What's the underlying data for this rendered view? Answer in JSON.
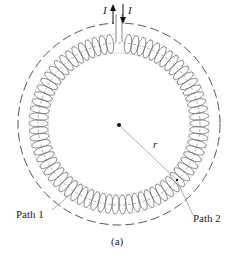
{
  "figure": {
    "caption": "(a)",
    "current_label_up": "I",
    "current_label_down": "I",
    "radius_label": "r",
    "path1_label": "Path 1",
    "path2_label": "Path 2",
    "turns": 72,
    "colors": {
      "coil": "#6b6b6b",
      "dashed_path": "#555555",
      "leader_line": "#9a9a9a",
      "arrow": "#111111",
      "text": "#222222"
    }
  }
}
